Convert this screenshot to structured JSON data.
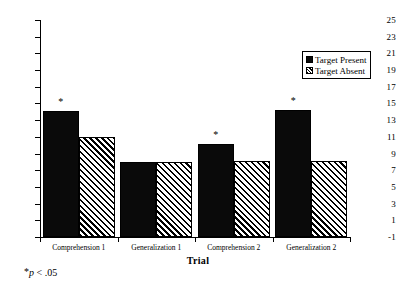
{
  "chart_data": {
    "type": "bar",
    "title": "",
    "xlabel": "Trial",
    "ylabel": "",
    "categories": [
      "Comprehension 1",
      "Generalization 1",
      "Comprehension 2",
      "Generalization 2"
    ],
    "series": [
      {
        "name": "Target Present",
        "values": [
          14.1,
          8.0,
          10.1,
          14.2
        ],
        "fill": "solid-black"
      },
      {
        "name": "Target Absent",
        "values": [
          11.0,
          8.0,
          8.1,
          8.15
        ],
        "fill": "diagonal-hatch"
      }
    ],
    "ylim": [
      -1,
      25
    ],
    "ytick_step": 2,
    "ytick_labels": [
      "25",
      "23",
      "21",
      "19",
      "17",
      "15",
      "13",
      "11",
      "9",
      "7",
      "5",
      "3",
      "1",
      "-1"
    ],
    "grid": false,
    "legend_position": "top-right",
    "annotations": [
      {
        "text": "*",
        "category": "Comprehension 1",
        "series": "Target Present"
      },
      {
        "text": "*",
        "category": "Comprehension 2",
        "series": "Target Present"
      },
      {
        "text": "*",
        "category": "Generalization 2",
        "series": "Target Present"
      }
    ],
    "footnote": {
      "star": "*",
      "p": "p",
      "rest": " <  .05"
    },
    "colors": {
      "series_1": "#000000",
      "series_2": "#ffffff",
      "axis": "#000000",
      "background": "#ffffff"
    }
  },
  "legend": {
    "items": [
      {
        "label": "Target Present"
      },
      {
        "label": "Target Absent"
      }
    ]
  }
}
